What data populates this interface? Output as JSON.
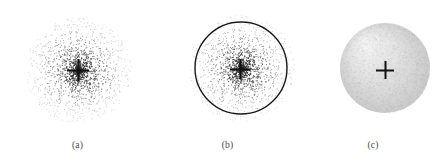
{
  "figure": {
    "background": "#ffffff",
    "width": 446,
    "height": 164,
    "panels": [
      {
        "id": "a",
        "caption": "(a)",
        "type": "scatter",
        "description": "radial point cloud with central cross marker",
        "center": {
          "x": 78,
          "y": 70
        },
        "cloud_radius": 53,
        "point_count": 1500,
        "point_size": 1.0,
        "point_color": "#303030",
        "has_boundary_circle": false,
        "marker": {
          "name": "cross",
          "x": 78,
          "y": 70,
          "arm_length": 11,
          "thickness": 2.2,
          "color": "#111111"
        }
      },
      {
        "id": "b",
        "caption": "(b)",
        "type": "scatter",
        "description": "radial point cloud with overlaid boundary circle and central cross marker",
        "center": {
          "x": 86,
          "y": 68
        },
        "cloud_radius": 53,
        "point_count": 1500,
        "point_size": 1.0,
        "point_color": "#303030",
        "has_boundary_circle": true,
        "boundary_circle": {
          "x": 86,
          "y": 68,
          "radius": 46,
          "stroke": "#1a1a1a",
          "stroke_width": 1.4
        },
        "marker": {
          "name": "cross",
          "x": 85,
          "y": 69,
          "arm_length": 10,
          "thickness": 2.2,
          "color": "#111111"
        }
      },
      {
        "id": "c",
        "caption": "(c)",
        "type": "disk",
        "description": "solid shaded gray disk with central cross marker",
        "center": {
          "x": 85,
          "y": 68
        },
        "disk_radius": 45,
        "fill_light": "#f2f2f2",
        "fill_mid": "#e2e2e2",
        "fill_dark": "#c7c7c7",
        "has_boundary_circle": false,
        "marker": {
          "name": "cross",
          "x": 85,
          "y": 70,
          "arm_length": 9,
          "thickness": 2.0,
          "color": "#111111"
        }
      }
    ]
  },
  "chart_data": {
    "type": "scatter",
    "title": "",
    "xlabel": "",
    "ylabel": "",
    "grid": false,
    "legend": null,
    "panel_labels": [
      "(a)",
      "(b)",
      "(c)"
    ],
    "series": [
      {
        "name": "(a) point cloud",
        "distribution": "radially decaying density (dense core, sparse halo)",
        "n_points": 1500,
        "center": [
          78,
          70
        ],
        "max_radius": 53,
        "annotation": "cross marker at cloud centre"
      },
      {
        "name": "(b) point cloud with circle",
        "distribution": "radially decaying density (dense core, sparse halo)",
        "n_points": 1500,
        "center": [
          241,
          68
        ],
        "max_radius": 53,
        "circle_radius": 46,
        "annotation": "cross marker at cloud centre, circle delimiting inner region"
      },
      {
        "name": "(c) filled disk",
        "distribution": "uniform shaded fill",
        "center": [
          385,
          68
        ],
        "radius": 45,
        "annotation": "cross marker at disk centre"
      }
    ]
  }
}
